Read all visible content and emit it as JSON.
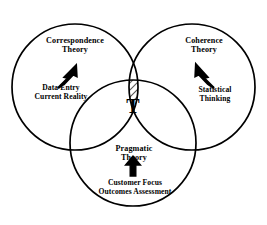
{
  "diagram": {
    "type": "venn-diagram-3-set",
    "center_symbol": "T",
    "center_symbol_meaning": "Truth",
    "stroke_color": "#000000",
    "fill_color": "#ffffff",
    "hatch_color": "#000000",
    "background_color": "#ffffff",
    "circles": [
      {
        "id": "correspondence",
        "theory_label_line1": "Correspondence",
        "theory_label_line2": "Theory",
        "concept_label_line1": "Data Entry",
        "concept_label_line2": "Current Reality",
        "arrow_direction": "up-right",
        "center_x": 75,
        "center_y": 87,
        "radius": 63
      },
      {
        "id": "coherence",
        "theory_label_line1": "Coherence",
        "theory_label_line2": "Theory",
        "concept_label_line1": "Statistical",
        "concept_label_line2": "Thinking",
        "arrow_direction": "up-left",
        "center_x": 192,
        "center_y": 87,
        "radius": 63
      },
      {
        "id": "pragmatic",
        "theory_label_line1": "Pragmatic",
        "theory_label_line2": "Theory",
        "concept_label_line1": "Customer Focus",
        "concept_label_line2": "Outcomes Assessment",
        "arrow_direction": "up",
        "center_x": 133,
        "center_y": 143,
        "radius": 63
      }
    ]
  },
  "labels": {
    "correspondence_theory": "Correspondence\nTheory",
    "correspondence_concept": "Data Entry\nCurrent Reality",
    "coherence_theory": "Coherence\nTheory",
    "coherence_concept": "Statistical\nThinking",
    "pragmatic_theory": "Pragmatic\nTheory",
    "pragmatic_concept": "Customer Focus\nOutcomes Assessment",
    "center": "T"
  },
  "icons": {
    "arrow_correspondence": "arrow-up-right-icon",
    "arrow_coherence": "arrow-up-left-icon",
    "arrow_pragmatic": "arrow-up-icon"
  }
}
